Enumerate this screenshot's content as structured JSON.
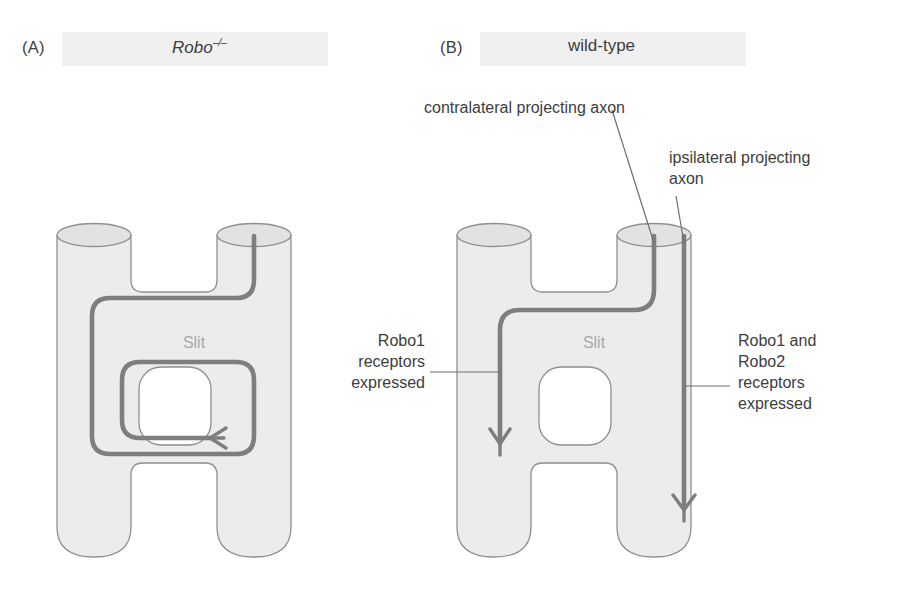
{
  "figure": {
    "panels": [
      {
        "letter": "(A)",
        "title_main": "Robo",
        "title_sup": "–/–",
        "genotype": "Robo-/- mutant",
        "midline_label": "Slit"
      },
      {
        "letter": "(B)",
        "title_main": "wild-type",
        "title_sup": "",
        "genotype": "wild-type",
        "midline_label": "Slit"
      }
    ],
    "annotations": {
      "contralateral": "contralateral projecting axon",
      "ipsilateral": "ipsilateral projecting\naxon",
      "robo1_left": "Robo1\nreceptors\nexpressed",
      "robo12_right": "Robo1 and\nRobo2\nreceptors\nexpressed"
    },
    "colors": {
      "tube_fill": "#ececec",
      "tube_top_fill": "#e0e0e0",
      "tube_stroke": "#8f8f8f",
      "axon": "#7e7e7e",
      "axon_dark": "#6a6a6a",
      "text": "#3d3d3d",
      "slit_text": "#a8a8a8",
      "band": "#f0f0f0",
      "leader": "#6e6e6e",
      "background": "#ffffff"
    }
  }
}
